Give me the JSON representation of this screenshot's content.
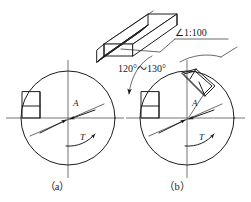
{
  "figure": {
    "background_color": "#ffffff",
    "line_color": "#1d1d1d",
    "hatch_color": "#3a3a3a"
  },
  "taper_callout": {
    "label": "∠1:100",
    "name": "taper-ratio-label"
  },
  "angle_callout": {
    "label": "120°～130°",
    "name": "chamfer-angle-label"
  },
  "captions": [
    {
      "label": "（a）",
      "name": "caption-a"
    },
    {
      "label": "（b）",
      "name": "caption-b"
    }
  ],
  "shaft_a": {
    "caption": "（a）",
    "force_label": "A",
    "torque_label": "T"
  },
  "shaft_b": {
    "caption": "（b）",
    "force_label": "A",
    "torque_label": "T"
  },
  "key_isometric": {
    "name": "tapered-key-3d-view"
  }
}
